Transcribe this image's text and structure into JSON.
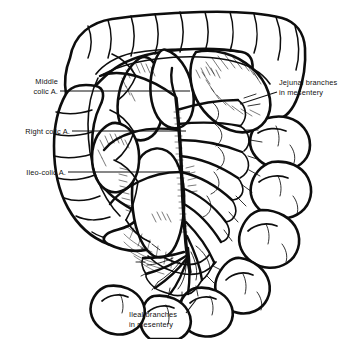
{
  "figure": {
    "background_color": "#ffffff",
    "ink_color": "#0d0d0d",
    "width": 345,
    "height": 339
  },
  "labels": {
    "middle_colic": {
      "line1": "Middle",
      "line2": "colic A.",
      "x": 58,
      "y": 84,
      "align": "end"
    },
    "right_colic": {
      "line1": "Right colic A.",
      "x": 70,
      "y": 134,
      "align": "end"
    },
    "ileo_colic": {
      "line1": "Ileo-colic A.",
      "x": 66,
      "y": 175,
      "align": "end"
    },
    "jejunal_branches": {
      "line1": "Jejunal branches",
      "line2": "in mesentery",
      "x": 279,
      "y": 85,
      "align": "start"
    },
    "ileal_branches": {
      "line1": "Ileal branches",
      "line2": "in mesentery",
      "x": 129,
      "y": 317,
      "align": "start"
    }
  },
  "anatomy": {
    "structures": [
      "transverse colon",
      "ascending colon",
      "hepatic flexure",
      "splenic flexure",
      "cecum",
      "terminal ileum",
      "jejunal loops",
      "ileal loops",
      "mesentery",
      "superior mesenteric artery trunk",
      "marginal artery",
      "vascular arcades"
    ]
  }
}
